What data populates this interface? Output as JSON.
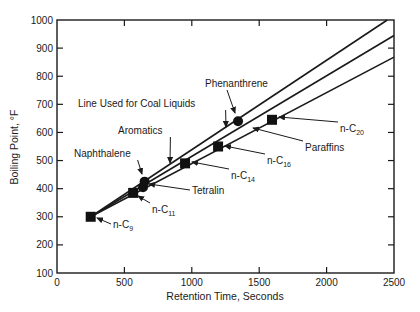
{
  "chart_data": {
    "type": "scatter",
    "title": "",
    "xlabel": "Retention Time, Seconds",
    "ylabel": "Boiling Point, °F",
    "xlim": [
      0,
      2500
    ],
    "ylim": [
      100,
      1000
    ],
    "xticks": [
      0,
      500,
      1000,
      1500,
      2000,
      2500
    ],
    "yticks": [
      100,
      200,
      300,
      400,
      500,
      600,
      700,
      800,
      900,
      1000
    ],
    "grid": false,
    "legend": null,
    "series": [
      {
        "name": "Paraffins",
        "marker": "square",
        "points": [
          {
            "label": "n-C9",
            "label_sub": "9",
            "x": 250,
            "y": 300
          },
          {
            "label": "n-C11",
            "label_sub": "11",
            "x": 565,
            "y": 385
          },
          {
            "label": "n-C14",
            "label_sub": "14",
            "x": 950,
            "y": 490
          },
          {
            "label": "n-C16",
            "label_sub": "16",
            "x": 1195,
            "y": 550
          },
          {
            "label": "n-C20",
            "label_sub": "20",
            "x": 1595,
            "y": 645
          }
        ]
      },
      {
        "name": "Aromatics",
        "marker": "circle",
        "points": [
          {
            "label": "Tetralin",
            "x": 638,
            "y": 405
          },
          {
            "label": "Naphthalene",
            "x": 650,
            "y": 425
          },
          {
            "label": "Phenanthrene",
            "x": 1343,
            "y": 640
          }
        ]
      }
    ],
    "lines": [
      {
        "name": "Aromatics",
        "x": [
          250,
          2450
        ],
        "y": [
          300,
          1000
        ]
      },
      {
        "name": "Line Used for Coal Liquids",
        "x": [
          250,
          2500
        ],
        "y": [
          300,
          945
        ]
      },
      {
        "name": "Paraffins",
        "x": [
          250,
          2500
        ],
        "y": [
          300,
          868
        ]
      }
    ],
    "annotations": [
      {
        "text": "Phenanthrene",
        "text_x": 205,
        "text_y": 87,
        "arrow_to": [
          235,
          113
        ]
      },
      {
        "text": "Line Used for Coal Liquids",
        "text_x": 78,
        "text_y": 107,
        "arrow_to": [
          226,
          127
        ]
      },
      {
        "text": "Aromatics",
        "text_x": 118,
        "text_y": 134,
        "arrow_to": [
          170,
          163
        ]
      },
      {
        "text": "Naphthalene",
        "text_x": 74,
        "text_y": 157,
        "arrow_to": [
          142,
          174
        ]
      },
      {
        "text": "Tetralin",
        "text_x": 192,
        "text_y": 194,
        "arrow_to": [
          149,
          184
        ]
      },
      {
        "text": "n-C",
        "sub": "11",
        "text_x": 152,
        "text_y": 213,
        "arrow_to": [
          138,
          196
        ]
      },
      {
        "text": "n-C",
        "sub": "9",
        "text_x": 113,
        "text_y": 228,
        "arrow_to": [
          97,
          218
        ]
      },
      {
        "text": "n-C",
        "sub": "14",
        "text_x": 231,
        "text_y": 179,
        "arrow_to": [
          192,
          162
        ]
      },
      {
        "text": "n-C",
        "sub": "16",
        "text_x": 267,
        "text_y": 164,
        "arrow_to": [
          225,
          146
        ]
      },
      {
        "text": "Paraffins",
        "text_x": 305,
        "text_y": 151,
        "arrow_to": [
          253,
          128
        ]
      },
      {
        "text": "n-C",
        "sub": "20",
        "text_x": 340,
        "text_y": 132,
        "arrow_to": [
          279,
          117
        ]
      }
    ]
  },
  "layout": {
    "plot_left": 57,
    "plot_right": 394,
    "plot_top": 20,
    "plot_bottom": 273,
    "line_color": "#1a1a1a",
    "marker_color": "#111111"
  }
}
